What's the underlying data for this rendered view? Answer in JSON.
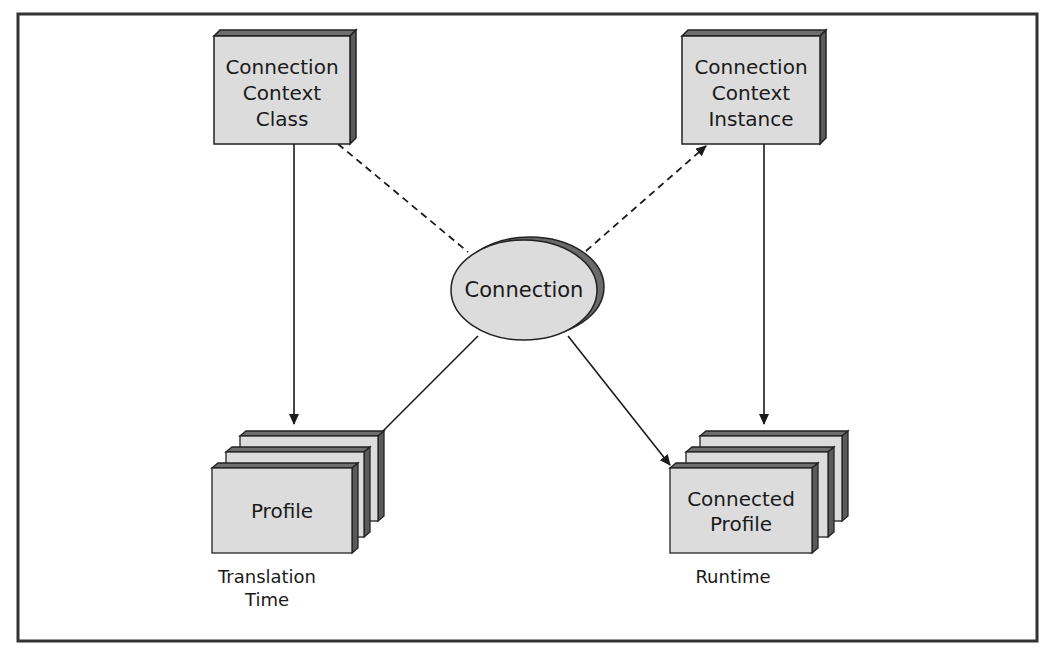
{
  "colors": {
    "box_fill": "#dcdcdc",
    "box_top": "#6e6e6e",
    "box_side": "#5a5a5a",
    "stroke": "#222222",
    "border": "#333333",
    "background": "#ffffff"
  },
  "nodes": {
    "ctx_class": {
      "lines": [
        "Connection",
        "Context",
        "Class"
      ]
    },
    "ctx_instance": {
      "lines": [
        "Connection",
        "Context",
        "Instance"
      ]
    },
    "connection": {
      "label": "Connection"
    },
    "profile": {
      "label": "Profile",
      "caption": [
        "Translation",
        "Time"
      ]
    },
    "connected_profile": {
      "lines": [
        "Connected",
        "Profile"
      ],
      "caption": [
        "Runtime"
      ]
    }
  },
  "edges": [
    {
      "from": "ctx_class",
      "to": "profile",
      "style": "solid",
      "arrow": true
    },
    {
      "from": "ctx_class",
      "to": "connection",
      "style": "dashed",
      "arrow": false
    },
    {
      "from": "connection",
      "to": "ctx_instance",
      "style": "dashed",
      "arrow": true
    },
    {
      "from": "ctx_instance",
      "to": "connected_profile",
      "style": "solid",
      "arrow": true
    },
    {
      "from": "connection",
      "to": "profile",
      "style": "solid",
      "arrow": false
    },
    {
      "from": "connection",
      "to": "connected_profile",
      "style": "solid",
      "arrow": true
    }
  ]
}
